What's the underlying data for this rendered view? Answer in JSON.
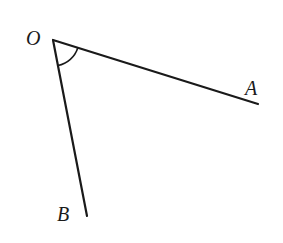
{
  "diagram": {
    "type": "angle",
    "colors": {
      "stroke": "#1a1a1a",
      "background": "#ffffff"
    },
    "points": {
      "O": {
        "label": "O",
        "x": 53,
        "y": 40,
        "label_x": 26,
        "label_y": 45
      },
      "A": {
        "label": "A",
        "x": 258,
        "y": 104,
        "label_x": 245,
        "label_y": 95
      },
      "B": {
        "label": "B",
        "x": 87,
        "y": 216,
        "label_x": 57,
        "label_y": 221
      }
    },
    "segments": [
      {
        "from": "O",
        "to": "A"
      },
      {
        "from": "O",
        "to": "B"
      }
    ],
    "angle_mark": {
      "vertex": "O",
      "between": [
        "A",
        "B"
      ],
      "radius": 26
    }
  }
}
